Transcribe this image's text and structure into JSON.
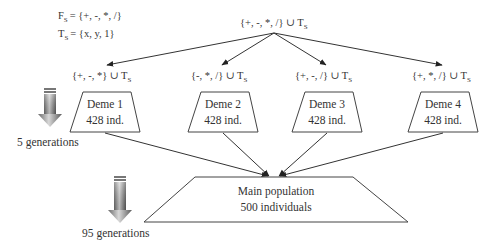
{
  "function_set": {
    "label": "F",
    "subscript": "S",
    "value": "= {+, -, *, /}"
  },
  "terminal_set": {
    "label": "T",
    "subscript": "S",
    "value": "= {x, y, 1}"
  },
  "root_set": {
    "text": "{+, -, *, /} ∪ T",
    "subscript": "S"
  },
  "demes": [
    {
      "set_text": "{+, -, *} ∪ T",
      "set_sub": "S",
      "name": "Deme 1",
      "size": "428 ind."
    },
    {
      "set_text": "{-, *, /} ∪ T",
      "set_sub": "S",
      "name": "Deme 2",
      "size": "428 ind."
    },
    {
      "set_text": "{+, -, /} ∪ T",
      "set_sub": "S",
      "name": "Deme 3",
      "size": "428 ind."
    },
    {
      "set_text": "{+, *, /} ∪ T",
      "set_sub": "S",
      "name": "Deme 4",
      "size": "428 ind."
    }
  ],
  "main_population": {
    "title": "Main population",
    "size": "500 individuals"
  },
  "phase1": {
    "label": "5 generations"
  },
  "phase2": {
    "label": "95 generations"
  },
  "icons": {
    "phase_arrow": "down-arrow-gradient"
  }
}
